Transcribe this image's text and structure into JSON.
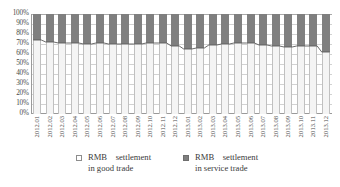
{
  "chart_data": {
    "type": "bar",
    "subtype": "100% stacked column with boundary line",
    "title": "",
    "xlabel": "",
    "ylabel": "",
    "ylim": [
      0,
      100
    ],
    "grid": true,
    "legend_position": "bottom",
    "categories": [
      "2012.01",
      "2012.02",
      "2012.03",
      "2012.04",
      "2012.05",
      "2012.06",
      "2012.07",
      "2012.08",
      "2012.09",
      "2012.10",
      "2012.11",
      "2012.12",
      "2013.01",
      "2013.02",
      "2013.03",
      "2013.04",
      "2013.05",
      "2013.06",
      "2013.07",
      "2013.08",
      "2013.09",
      "2013.10",
      "2013.11",
      "2013.12"
    ],
    "ytick_labels": [
      "0%",
      "10%",
      "20%",
      "30%",
      "40%",
      "50%",
      "60%",
      "70%",
      "80%",
      "90%",
      "100%"
    ],
    "ytick_values": [
      0,
      10,
      20,
      30,
      40,
      50,
      60,
      70,
      80,
      90,
      100
    ],
    "series": [
      {
        "name": "RMB settlement in good trade",
        "color": "#f4f4f4",
        "values": [
          74,
          72,
          71,
          71,
          70,
          71,
          70,
          70,
          70,
          71,
          71,
          68,
          65,
          66,
          69,
          70,
          71,
          71,
          69,
          68,
          67,
          68,
          68,
          62
        ]
      },
      {
        "name": "RMB settlement in service trade",
        "color": "#7f7f7f",
        "values": [
          26,
          28,
          29,
          29,
          30,
          29,
          30,
          30,
          30,
          29,
          29,
          32,
          35,
          34,
          31,
          30,
          29,
          29,
          31,
          32,
          33,
          32,
          32,
          38
        ]
      }
    ]
  },
  "legend": {
    "entries": [
      {
        "line1": "RMB    settlement",
        "line2": "in good trade",
        "marker": "hollow-square"
      },
      {
        "line1": "RMB    settlement",
        "line2": "in service trade",
        "marker": "filled-square"
      }
    ]
  },
  "colors": {
    "good_trade": "#f4f4f4",
    "service_trade": "#7f7f7f",
    "gridline": "#d2d2d2",
    "axis": "#9a9a9a",
    "text": "#3a3a3a"
  }
}
